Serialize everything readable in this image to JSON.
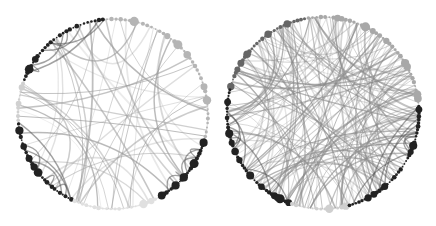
{
  "figure": {
    "panels": [
      {
        "name": "left-network",
        "cx": 113,
        "cy": 114,
        "r": 95,
        "edge_density": "sparse",
        "edge_count": 45,
        "groups": [
          {
            "from": 95,
            "to": 160,
            "color": "#222222",
            "count": 28
          },
          {
            "from": 160,
            "to": 185,
            "color": "#d0d0d0",
            "count": 10
          },
          {
            "from": 185,
            "to": 245,
            "color": "#222222",
            "count": 30
          },
          {
            "from": 245,
            "to": 300,
            "color": "#e0e0e0",
            "count": 22
          },
          {
            "from": 300,
            "to": 345,
            "color": "#222222",
            "count": 26
          },
          {
            "from": 345,
            "to": 455,
            "color": "#b5b5b5",
            "count": 40
          }
        ],
        "edge_color": "#9a9a9a",
        "seed": 7
      },
      {
        "name": "right-network",
        "cx": 323,
        "cy": 113,
        "r": 96,
        "edge_density": "dense",
        "edge_count": 150,
        "groups": [
          {
            "from": 100,
            "to": 165,
            "color": "#666666",
            "count": 30
          },
          {
            "from": 165,
            "to": 250,
            "color": "#222222",
            "count": 45
          },
          {
            "from": 250,
            "to": 285,
            "color": "#cfcfcf",
            "count": 14
          },
          {
            "from": 285,
            "to": 365,
            "color": "#222222",
            "count": 40
          },
          {
            "from": 365,
            "to": 460,
            "color": "#a8a8a8",
            "count": 38
          }
        ],
        "edge_color": "#8a8a8a",
        "seed": 19
      }
    ]
  }
}
